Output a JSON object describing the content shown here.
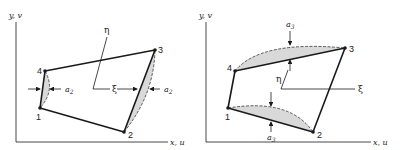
{
  "colors": {
    "line": "#1a1a1a",
    "shade": "#d9d9d9",
    "background": "#ffffff"
  },
  "left_diagram": {
    "y_axis_label": "y, v",
    "x_axis_label": "x, u",
    "nodes": [
      {
        "id": "1",
        "label": "1"
      },
      {
        "id": "2",
        "label": "2"
      },
      {
        "id": "3",
        "label": "3"
      },
      {
        "id": "4",
        "label": "4"
      }
    ],
    "eta_label": "η",
    "xi_label": "ξ",
    "amplitude_label_left": "a",
    "amplitude_sub_left": "2",
    "amplitude_label_right": "a",
    "amplitude_sub_right": "2",
    "description": "Quadrilateral element with sides 1-4 and 2-3 bulging (mode a2)"
  },
  "right_diagram": {
    "y_axis_label": "y, v",
    "x_axis_label": "x, u",
    "nodes": [
      {
        "id": "1",
        "label": "1"
      },
      {
        "id": "2",
        "label": "2"
      },
      {
        "id": "3",
        "label": "3"
      },
      {
        "id": "4",
        "label": "4"
      }
    ],
    "eta_label": "η",
    "xi_label": "ξ",
    "amplitude_label_top": "a",
    "amplitude_sub_top": "3",
    "amplitude_label_bottom": "a",
    "amplitude_sub_bottom": "3",
    "description": "Quadrilateral element with sides 4-3 and 1-2 bulging (mode a3)"
  }
}
